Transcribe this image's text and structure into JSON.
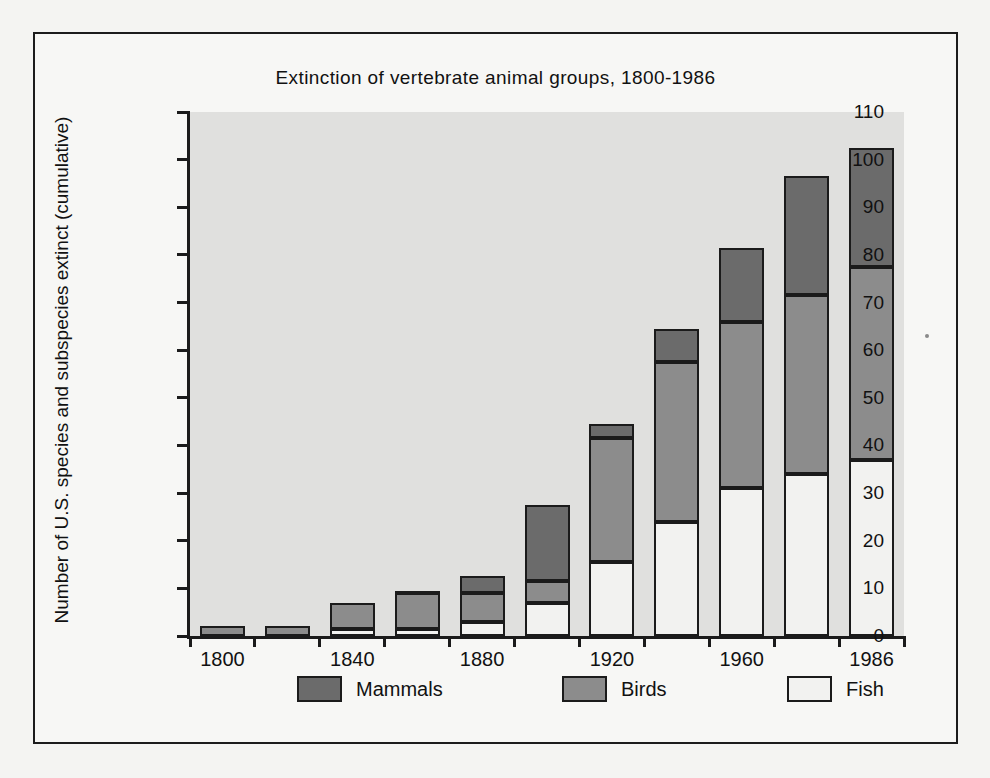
{
  "chart_data": {
    "type": "bar",
    "subtype": "stacked-bar",
    "title": "Extinction of vertebrate animal groups, 1800-1986",
    "xlabel": "",
    "ylabel": "Number of U.S. species and subspecies extinct (cumulative)",
    "ylim": [
      0,
      110
    ],
    "ytick_step": 10,
    "yticks": [
      0,
      10,
      20,
      30,
      40,
      50,
      60,
      70,
      80,
      90,
      100,
      110
    ],
    "grid": false,
    "legend_position": "bottom",
    "x_tick_labels": [
      "1800",
      "1840",
      "1880",
      "1920",
      "1960",
      "1986"
    ],
    "categories": [
      "1800",
      "1820",
      "1840",
      "1860",
      "1880",
      "1900",
      "1920",
      "1940",
      "1960",
      "1980",
      "1986"
    ],
    "series": [
      {
        "name": "Fish",
        "color": "#f2f2f0",
        "values": [
          0,
          0,
          1.5,
          1.5,
          3,
          7,
          15.5,
          24,
          31,
          34,
          37
        ]
      },
      {
        "name": "Birds",
        "color": "#8c8c8c",
        "values": [
          2,
          2,
          5.5,
          7.5,
          6,
          4.5,
          26,
          33.5,
          35,
          37.5,
          40.5
        ]
      },
      {
        "name": "Mammals",
        "color": "#6b6b6b",
        "values": [
          0,
          0,
          0,
          0.5,
          3.5,
          16,
          3,
          7,
          15.5,
          25,
          25
        ]
      }
    ],
    "totals": [
      2,
      2,
      7,
      9.5,
      12.5,
      27.5,
      44.5,
      64.5,
      81.5,
      96.5,
      102.5
    ],
    "legend": [
      {
        "label": "Mammals",
        "swatch": "#6b6b6b"
      },
      {
        "label": "Birds",
        "swatch": "#8c8c8c"
      },
      {
        "label": "Fish",
        "swatch": "#f2f2f0"
      }
    ]
  },
  "colors": {
    "plot_background": "#e0e0de",
    "figure_background": "#f7f7f5",
    "page_background": "#f4f4f2",
    "axis": "#1b1b1b",
    "text": "#111111"
  }
}
